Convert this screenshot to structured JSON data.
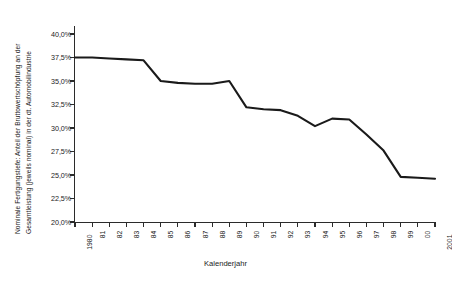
{
  "chart_data": {
    "type": "line",
    "title": "",
    "ylabel": "Nominale Fertigungstiefe: Anteil der Bruttowertschöpfung an der Gesamtleistung (jeweils nominal) in der dt. Automobilindustrie",
    "ylabel_line1": "Nominale Fertigungstiefe: Anteil der Bruttowertschöpfung an der",
    "ylabel_line2": "Gesamtleistung (jeweils nominal) in der dt. Automobilindustrie",
    "xlabel": "Kalenderjahr",
    "ylim": [
      20.0,
      40.0
    ],
    "ytick_values": [
      40.0,
      37.5,
      35.0,
      32.5,
      30.0,
      27.5,
      25.0,
      22.5,
      20.0
    ],
    "ytick_labels": [
      "40,0%",
      "37,5%",
      "35,0%",
      "32,5%",
      "30,0%",
      "27,5%",
      "25,0%",
      "22,5%",
      "20,0%"
    ],
    "categories": [
      "1980",
      "81",
      "82",
      "83",
      "84",
      "85",
      "86",
      "87",
      "88",
      "89",
      "90",
      "91",
      "92",
      "93",
      "94",
      "95",
      "96",
      "97",
      "98",
      "99",
      "00",
      "2001"
    ],
    "x": [
      1980,
      1981,
      1982,
      1983,
      1984,
      1985,
      1986,
      1987,
      1988,
      1989,
      1990,
      1991,
      1992,
      1993,
      1994,
      1995,
      1996,
      1997,
      1998,
      1999,
      2000,
      2001
    ],
    "values": [
      37.5,
      37.5,
      37.4,
      37.3,
      37.2,
      35.0,
      34.8,
      34.7,
      34.7,
      35.0,
      32.2,
      32.0,
      31.9,
      31.3,
      30.2,
      31.0,
      30.9,
      29.3,
      27.6,
      24.8,
      24.7,
      24.6
    ],
    "series": [
      {
        "name": "Nominale Fertigungstiefe",
        "color": "#1a1a1a",
        "values": [
          37.5,
          37.5,
          37.4,
          37.3,
          37.2,
          35.0,
          34.8,
          34.7,
          34.7,
          35.0,
          32.2,
          32.0,
          31.9,
          31.3,
          30.2,
          31.0,
          30.9,
          29.3,
          27.6,
          24.8,
          24.7,
          24.6
        ]
      }
    ],
    "grid": false,
    "legend": "none",
    "line_color": "#1a1a1a",
    "axis_color": "#2b2b2b"
  }
}
